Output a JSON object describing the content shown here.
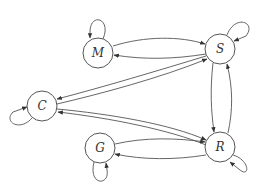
{
  "diagram": {
    "type": "directed-graph",
    "nodes": [
      {
        "id": "M",
        "label": "M",
        "x": 98,
        "y": 53
      },
      {
        "id": "S",
        "label": "S",
        "x": 220,
        "y": 49
      },
      {
        "id": "C",
        "label": "C",
        "x": 42,
        "y": 106
      },
      {
        "id": "G",
        "label": "G",
        "x": 100,
        "y": 148
      },
      {
        "id": "R",
        "label": "R",
        "x": 220,
        "y": 147
      }
    ],
    "edges": [
      {
        "from": "M",
        "to": "M"
      },
      {
        "from": "M",
        "to": "S"
      },
      {
        "from": "S",
        "to": "M"
      },
      {
        "from": "S",
        "to": "S"
      },
      {
        "from": "S",
        "to": "C"
      },
      {
        "from": "C",
        "to": "S"
      },
      {
        "from": "C",
        "to": "C"
      },
      {
        "from": "C",
        "to": "R"
      },
      {
        "from": "R",
        "to": "C"
      },
      {
        "from": "S",
        "to": "R"
      },
      {
        "from": "R",
        "to": "S"
      },
      {
        "from": "G",
        "to": "R"
      },
      {
        "from": "R",
        "to": "G"
      },
      {
        "from": "G",
        "to": "G"
      },
      {
        "from": "R",
        "to": "R"
      }
    ],
    "colors": {
      "stroke": "#555555",
      "background": "#ffffff",
      "text": "#333333"
    }
  }
}
